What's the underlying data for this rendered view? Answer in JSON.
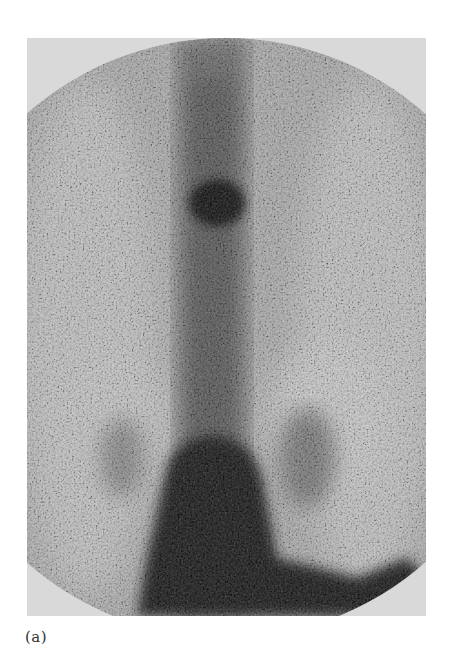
{
  "figure": {
    "caption": "(a)",
    "image_description": "Grayscale nuclear-medicine scintigraphy (posterior bone scan) showing spine with focal hot spot in upper thoracic region and intense uptake in lower pelvic region",
    "colors": {
      "frame_background": "#d9d9d9",
      "hot_spot": "#1a1a1a",
      "speckle_dark": "#2b2b2b",
      "caption_text": "#333333"
    },
    "regions": {
      "field_of_view": {
        "shape": "circle-clipped",
        "center_x": 199,
        "center_y": 300,
        "radius": 300
      },
      "hot_spot": {
        "center_x": 190,
        "center_y": 165,
        "radius_x": 33,
        "radius_y": 28
      },
      "spine_band": {
        "center_x": 185,
        "width": 90
      },
      "pelvic_uptake": {
        "top_y": 400,
        "bottom_y": 578
      }
    }
  }
}
